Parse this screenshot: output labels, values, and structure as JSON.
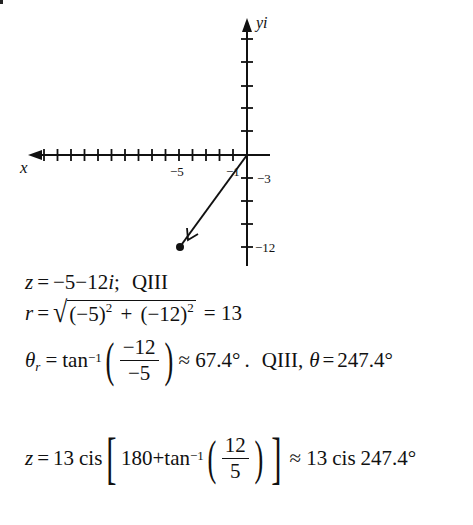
{
  "diagram": {
    "type": "complex-plane-plot",
    "axis_labels": {
      "x": "x",
      "y": "yi"
    },
    "tick_labels": {
      "x_neg5": "−5",
      "x_neg1": "−1",
      "y_neg3": "−3",
      "y_neg12": "−12"
    },
    "point": {
      "label": "z",
      "re": -5,
      "im": -12
    },
    "vector": {
      "from": [
        0,
        0
      ],
      "to": [
        -5,
        -12
      ]
    },
    "scale": {
      "x_unit": 1,
      "y_unit": 3
    }
  },
  "equations": {
    "line1": {
      "lhs": "z",
      "eq": "=",
      "rhs": "−5−12",
      "i": "i",
      "sep": ";",
      "quadrant": "QIII"
    },
    "line2": {
      "lhs": "r",
      "eq": "=",
      "rad_a": "(−5)",
      "exp_a": "2",
      "plus": "+",
      "rad_b": "(−12)",
      "exp_b": "2",
      "result": "= 13"
    },
    "line3": {
      "theta": "θ",
      "sub": "r",
      "eq": "=",
      "fn": "tan",
      "inv": "−1",
      "num": "−12",
      "den": "−5",
      "approx": "≈ 67.4°",
      "dot": ".",
      "quadrant": "QIII,",
      "theta2": "θ",
      "eq2": "=",
      "value": "247.4°"
    },
    "line4": {
      "lhs": "z",
      "eq": "=",
      "mod": "13",
      "cis": "cis",
      "inner_a": "180+tan",
      "inv": "−1",
      "num": "12",
      "den": "5",
      "approx": "≈ 13",
      "cis2": "cis",
      "value": "247.4°"
    }
  }
}
